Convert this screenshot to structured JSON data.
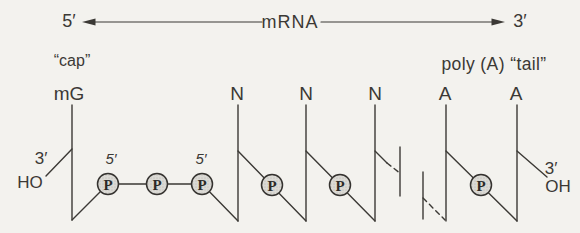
{
  "figure": {
    "axis": {
      "left_end": "5′",
      "molecule": "mRNA",
      "right_end": "3′"
    },
    "cap": {
      "label": "“cap”",
      "base": "mG",
      "three_prime": "3′",
      "hydroxyl": "HO",
      "five_prime_first": "5′",
      "five_prime_second": "5′"
    },
    "tail": {
      "label": "poly (A) “tail”",
      "three_prime": "3′",
      "hydroxyl": "OH"
    },
    "bases": [
      "N",
      "N",
      "N",
      "A",
      "A"
    ],
    "phosphate": "P",
    "colors": {
      "ink": "#3b3935",
      "paper": "#f3f2ee",
      "phosphate_fill": "#dbdad5",
      "phosphate_stipple": "#b3b1ac"
    }
  }
}
